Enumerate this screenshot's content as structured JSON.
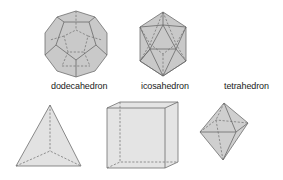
{
  "figure": {
    "title": "",
    "shapes": [
      {
        "id": "dodecahedron",
        "label": "dodecahedron"
      },
      {
        "id": "icosahedron",
        "label": "icosahedron"
      },
      {
        "id": "tetrahedron",
        "label": "tetrahedron"
      },
      {
        "id": "tetrahedron-solid",
        "label": ""
      },
      {
        "id": "cube",
        "label": ""
      },
      {
        "id": "octahedron",
        "label": ""
      }
    ]
  },
  "colors": {
    "fill_dark": "#c9c9c9",
    "fill_light": "#e2e2e2",
    "edge": "#6e6e6e"
  }
}
